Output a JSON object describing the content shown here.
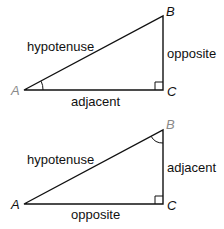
{
  "diagrams": [
    {
      "name": "triangle-angle-A",
      "vertices": {
        "A": "A",
        "B": "B",
        "C": "C"
      },
      "highlighted_angle": "A",
      "sides": {
        "hypotenuse": "hypotenuse",
        "vertical": "opposite",
        "horizontal": "adjacent"
      },
      "colors": {
        "highlighted_vertex": "#8a8a8a",
        "line": "#111111"
      }
    },
    {
      "name": "triangle-angle-B",
      "vertices": {
        "A": "A",
        "B": "B",
        "C": "C"
      },
      "highlighted_angle": "B",
      "sides": {
        "hypotenuse": "hypotenuse",
        "vertical": "adjacent",
        "horizontal": "opposite"
      },
      "colors": {
        "highlighted_vertex": "#8a8a8a",
        "line": "#111111"
      }
    }
  ]
}
